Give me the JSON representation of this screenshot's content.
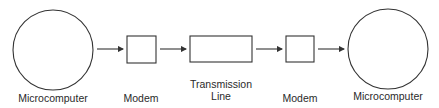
{
  "diagram": {
    "nodes": [
      {
        "id": "micro1",
        "shape": "circle",
        "label": "Microcomputer"
      },
      {
        "id": "modem1",
        "shape": "square",
        "label": "Modem"
      },
      {
        "id": "line",
        "shape": "rect",
        "label_line1": "Transmission",
        "label_line2": "Line"
      },
      {
        "id": "modem2",
        "shape": "square",
        "label": "Modem"
      },
      {
        "id": "micro2",
        "shape": "circle",
        "label": "Microcomputer"
      }
    ],
    "edges": [
      {
        "from": "micro1",
        "to": "modem1"
      },
      {
        "from": "modem1",
        "to": "line"
      },
      {
        "from": "line",
        "to": "modem2"
      },
      {
        "from": "modem2",
        "to": "micro2"
      }
    ],
    "colors": {
      "stroke": "#333333",
      "text": "#2a2a2a",
      "background": "#ffffff"
    }
  }
}
